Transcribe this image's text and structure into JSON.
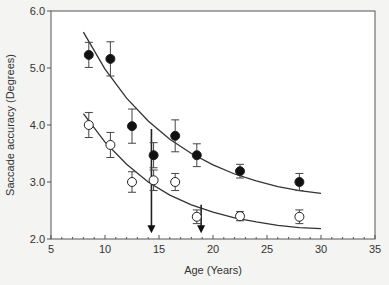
{
  "chart_data": {
    "type": "scatter",
    "title": "",
    "xlabel": "Age (Years)",
    "ylabel": "Saccade accuracy (Degrees)",
    "xlim": [
      5,
      35
    ],
    "ylim": [
      2.0,
      6.0
    ],
    "x_ticks": [
      5,
      10,
      15,
      20,
      25,
      30,
      35
    ],
    "y_ticks": [
      "2.0",
      "3.0",
      "4.0",
      "5.0",
      "6.0"
    ],
    "grid": false,
    "legend": null,
    "series": [
      {
        "name": "filled",
        "marker": "filled-circle",
        "x": [
          8.5,
          10.5,
          12.5,
          14.5,
          16.5,
          18.5,
          22.5,
          28
        ],
        "y": [
          5.23,
          5.16,
          3.98,
          3.47,
          3.81,
          3.47,
          3.19,
          3.0
        ],
        "err": [
          0.22,
          0.3,
          0.3,
          0.22,
          0.28,
          0.2,
          0.12,
          0.15
        ]
      },
      {
        "name": "open",
        "marker": "open-circle",
        "x": [
          8.5,
          10.5,
          12.5,
          14.5,
          16.5,
          18.5,
          22.5,
          28
        ],
        "y": [
          4.0,
          3.65,
          3.0,
          3.03,
          3.0,
          2.39,
          2.4,
          2.39
        ],
        "err": [
          0.22,
          0.22,
          0.18,
          0.18,
          0.15,
          0.12,
          0.08,
          0.12
        ]
      }
    ],
    "fit_curves": [
      {
        "name": "filled-fit",
        "x": [
          8,
          10,
          12,
          14,
          16,
          18,
          20,
          22,
          24,
          26,
          28,
          30
        ],
        "y": [
          5.63,
          4.98,
          4.47,
          4.07,
          3.75,
          3.5,
          3.3,
          3.14,
          3.02,
          2.92,
          2.85,
          2.8
        ]
      },
      {
        "name": "open-fit",
        "x": [
          8,
          10,
          12,
          14,
          16,
          18,
          20,
          22,
          24,
          26,
          28,
          30
        ],
        "y": [
          4.2,
          3.7,
          3.31,
          3.0,
          2.77,
          2.6,
          2.47,
          2.37,
          2.3,
          2.24,
          2.2,
          2.18
        ]
      }
    ],
    "annotations": [
      {
        "type": "arrow",
        "x": 14.3,
        "y_from": 3.93,
        "y_to": 2.12
      },
      {
        "type": "arrow",
        "x": 18.9,
        "y_from": 2.6,
        "y_to": 2.12
      }
    ]
  }
}
